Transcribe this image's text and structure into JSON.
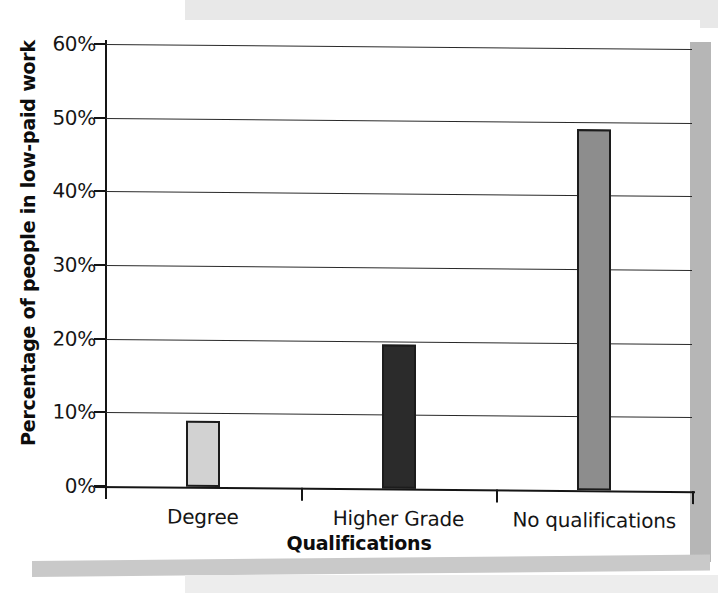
{
  "chart_data": {
    "type": "bar",
    "title": "",
    "subtitle": "",
    "xlabel": "Qualifications",
    "ylabel": "Percentage of people in low-paid work",
    "categories": [
      "Degree",
      "Higher Grade",
      "No qualifications"
    ],
    "values": [
      9,
      19.5,
      49
    ],
    "value_labels": [
      "9%",
      "19.5%",
      "49%"
    ],
    "ylim": [
      0,
      60
    ],
    "ytick_values": [
      0,
      10,
      20,
      30,
      40,
      50,
      60
    ],
    "ytick_labels": [
      "0%",
      "10%",
      "20%",
      "30%",
      "40%",
      "50%",
      "60%"
    ],
    "grid": true,
    "grid_axis": "y",
    "legend": false,
    "legend_position": "none",
    "bar_colors": [
      "#d2d2d2",
      "#2b2b2b",
      "#8d8d8d"
    ],
    "bar_edge_color": "#1c1c1c",
    "annotations": []
  },
  "artifacts": {
    "band_top_color": "#e8e8e8",
    "band_right_color": "#b6b6b6",
    "band_bottom_color": "#c9c9c9",
    "band_bottom2_color": "#ededed"
  }
}
